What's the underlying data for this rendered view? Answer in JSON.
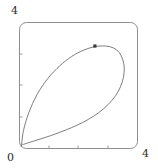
{
  "figure": {
    "title": "",
    "background_color": "#ffffff",
    "frame_color": "#8e8e8e",
    "curve_color": "#6e6e6e",
    "marker_color": "#3a3a3a",
    "label_color": "#2b2b2b"
  },
  "labels": {
    "y_max": "4",
    "origin": "0",
    "x_max": "4"
  },
  "chart_data": {
    "type": "line",
    "title": "",
    "xlabel": "",
    "ylabel": "",
    "xlim": [
      0,
      4
    ],
    "ylim": [
      0,
      4
    ],
    "xticks": [
      0,
      1,
      2,
      3,
      4
    ],
    "yticks": [
      0,
      1,
      2,
      3,
      4
    ],
    "xticklabels": [
      "0",
      "",
      "",
      "",
      "4"
    ],
    "yticklabels": [
      "0",
      "",
      "",
      "",
      "4"
    ],
    "grid": false,
    "legend": null,
    "series": [
      {
        "name": "closed-loop-orbit",
        "closed": true,
        "x": [
          0.05,
          0.12,
          0.3,
          0.58,
          0.95,
          1.35,
          1.75,
          2.15,
          2.55,
          2.9,
          3.18,
          3.38,
          3.5,
          3.55,
          3.52,
          3.42,
          3.25,
          3.0,
          2.68,
          2.32,
          1.95,
          1.58,
          1.22,
          0.88,
          0.58,
          0.35,
          0.18,
          0.08,
          0.04,
          0.05
        ],
        "y": [
          0.06,
          0.55,
          1.12,
          1.7,
          2.22,
          2.62,
          2.92,
          3.12,
          3.24,
          3.26,
          3.2,
          3.05,
          2.82,
          2.55,
          2.25,
          1.95,
          1.66,
          1.38,
          1.12,
          0.9,
          0.72,
          0.57,
          0.44,
          0.33,
          0.24,
          0.17,
          0.12,
          0.09,
          0.07,
          0.06
        ]
      }
    ],
    "markers": [
      {
        "name": "loop-apex-marker",
        "x": 2.55,
        "y": 3.26
      }
    ],
    "annotations": []
  }
}
